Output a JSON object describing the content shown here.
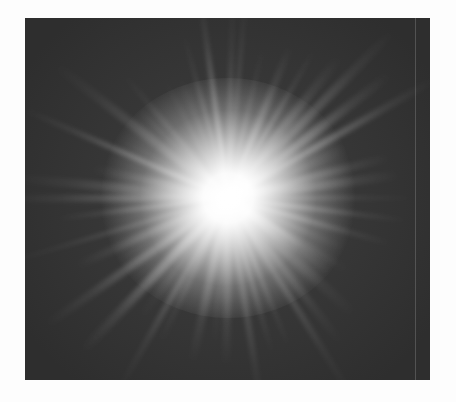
{
  "image": {
    "subject": "radial light burst",
    "description": "bright white starburst with radiating rays on a dark gray square background",
    "colors": {
      "page_background": "#fdfdfd",
      "square_background": "#2e2e2e",
      "center_glow": "#ffffff",
      "ray": "#e6e6e6"
    },
    "frame": {
      "left": 25,
      "top": 18,
      "width": 405,
      "height": 362
    },
    "burst_center": {
      "x": 228,
      "y": 198
    },
    "ray_count": 48
  }
}
